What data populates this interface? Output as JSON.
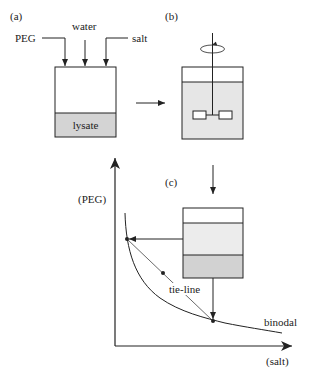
{
  "panels": {
    "a": {
      "label": "(a)",
      "inputs": [
        "PEG",
        "water",
        "salt"
      ],
      "layer": "lysate"
    },
    "b": {
      "label": "(b)"
    },
    "c": {
      "label": "(c)"
    }
  },
  "phase_diagram": {
    "y_axis_label": "(PEG)",
    "x_axis_label": "(salt)",
    "tie_line_label": "tie-line",
    "curve_label": "binodal"
  },
  "colors": {
    "line": "#222222",
    "lysate_fill": "#d4d4d4",
    "mixed_fill": "#e6e6e6",
    "top_phase_fill": "#ffffff",
    "middle_phase_fill": "#ececec",
    "bottom_phase_fill": "#d2d2d2"
  }
}
